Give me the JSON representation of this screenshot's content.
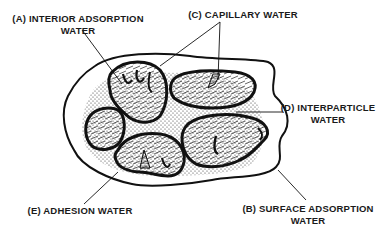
{
  "diagram": {
    "labels": {
      "a": {
        "line1": "(A) INTERIOR ADSORPTION",
        "line2": "WATER"
      },
      "b": {
        "line1": "(B) SURFACE ADSORPTION",
        "line2": "WATER"
      },
      "c": {
        "line1": "(C) CAPILLARY WATER"
      },
      "d": {
        "line1": "(D) INTERPARTICLE",
        "line2": "WATER"
      },
      "e": {
        "line1": "(E) ADHESION WATER"
      }
    },
    "colors": {
      "ink": "#111111",
      "background": "#ffffff"
    }
  }
}
